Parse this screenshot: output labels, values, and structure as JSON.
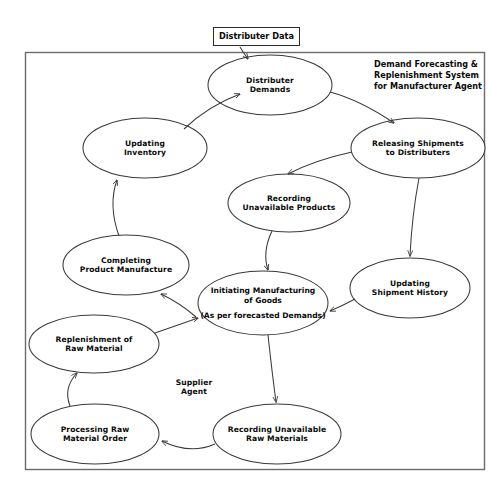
{
  "diagram": {
    "title": "Demand Forecasting &\nReplenishment System\nfor Manufacturer Agent",
    "external_input": {
      "label": "Distributer Data"
    },
    "free_labels": [
      {
        "id": "supplier-agent",
        "text": "Supplier\nAgent"
      }
    ],
    "nodes": [
      {
        "id": "distributer-demands",
        "label": "Distributer\nDemands",
        "cx": 270,
        "cy": 85,
        "rx": 62,
        "ry": 30
      },
      {
        "id": "updating-inventory",
        "label": "Updating\nInventory",
        "cx": 145,
        "cy": 148,
        "rx": 62,
        "ry": 30
      },
      {
        "id": "releasing-shipments",
        "label": "Releasing Shipments\nto Distributers",
        "cx": 418,
        "cy": 148,
        "rx": 67,
        "ry": 30
      },
      {
        "id": "recording-unavailable-products",
        "label": "Recording\nUnavailable Products",
        "cx": 289,
        "cy": 203,
        "rx": 61,
        "ry": 29
      },
      {
        "id": "completing-product-manufacture",
        "label": "Completing\nProduct Manufacture",
        "cx": 126,
        "cy": 265,
        "rx": 63,
        "ry": 30
      },
      {
        "id": "updating-shipment-history",
        "label": "Updating\nShipment History",
        "cx": 410,
        "cy": 288,
        "rx": 60,
        "ry": 30
      },
      {
        "id": "initiating-manufacturing",
        "label": "Initiating Manufacturing\nof Goods",
        "label2": "(As per forecasted Demands)",
        "cx": 263,
        "cy": 303,
        "rx": 65,
        "ry": 32
      },
      {
        "id": "replenishment-raw-material",
        "label": "Replenishment of\nRaw Material",
        "cx": 94,
        "cy": 344,
        "rx": 65,
        "ry": 29
      },
      {
        "id": "processing-raw-material-order",
        "label": "Processing Raw\nMaterial Order",
        "cx": 95,
        "cy": 434,
        "rx": 64,
        "ry": 30
      },
      {
        "id": "recording-unavailable-raw-materials",
        "label": "Recording Unavailable\nRaw Materials",
        "cx": 277,
        "cy": 434,
        "rx": 64,
        "ry": 30
      }
    ],
    "edges": [
      {
        "from": "distributer-data-box",
        "to": "distributer-demands"
      },
      {
        "from": "distributer-demands",
        "to": "releasing-shipments"
      },
      {
        "from": "releasing-shipments",
        "to": "recording-unavailable-products"
      },
      {
        "from": "releasing-shipments",
        "to": "updating-shipment-history"
      },
      {
        "from": "recording-unavailable-products",
        "to": "initiating-manufacturing"
      },
      {
        "from": "updating-shipment-history",
        "to": "initiating-manufacturing"
      },
      {
        "from": "initiating-manufacturing",
        "to": "completing-product-manufacture"
      },
      {
        "from": "initiating-manufacturing",
        "to": "recording-unavailable-raw-materials"
      },
      {
        "from": "completing-product-manufacture",
        "to": "updating-inventory"
      },
      {
        "from": "updating-inventory",
        "to": "distributer-demands"
      },
      {
        "from": "recording-unavailable-raw-materials",
        "to": "processing-raw-material-order"
      },
      {
        "from": "processing-raw-material-order",
        "to": "replenishment-raw-material"
      },
      {
        "from": "replenishment-raw-material",
        "to": "initiating-manufacturing"
      }
    ],
    "colors": {
      "stroke": "#3a3a3a",
      "frame": "#555555",
      "text": "#0a0a0a",
      "background": "#ffffff"
    }
  }
}
